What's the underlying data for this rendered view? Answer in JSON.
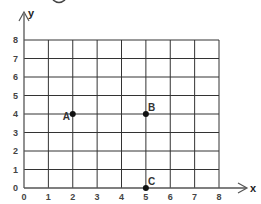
{
  "grid": {
    "x_range": [
      0,
      8
    ],
    "y_range": [
      0,
      8
    ],
    "x_ticks": [
      "0",
      "1",
      "2",
      "3",
      "4",
      "5",
      "6",
      "7",
      "8"
    ],
    "y_ticks": [
      "0",
      "1",
      "2",
      "3",
      "4",
      "5",
      "6",
      "7",
      "8"
    ],
    "x_axis_label": "x",
    "y_axis_label": "y",
    "line_color": "#333333"
  },
  "points": [
    {
      "label": "A",
      "x": 2,
      "y": 4,
      "label_side": "left"
    },
    {
      "label": "B",
      "x": 5,
      "y": 4,
      "label_side": "right"
    },
    {
      "label": "C",
      "x": 5,
      "y": 0,
      "label_side": "right"
    }
  ]
}
